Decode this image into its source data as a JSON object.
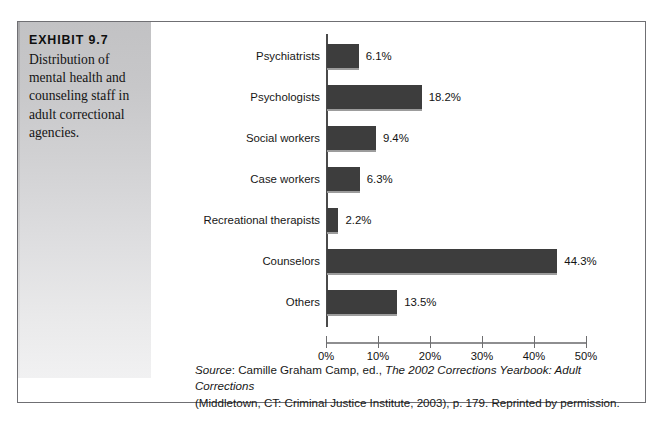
{
  "exhibit": {
    "number": "EXHIBIT 9.7",
    "caption": "Distribution of mental health and counseling staff in adult correctional agencies."
  },
  "source": {
    "label": "Source",
    "line1_pre": ": Camille Graham Camp, ed., ",
    "line1_title": "The 2002 Corrections Yearbook: Adult Corrections",
    "line2": "(Middletown, CT: Criminal Justice Institute, 2003), p. 179. Reprinted by permission."
  },
  "chart_data": {
    "type": "bar",
    "orientation": "horizontal",
    "title": "Distribution of mental health and counseling staff in adult correctional agencies.",
    "xlabel": "",
    "ylabel": "",
    "xlim": [
      0,
      50
    ],
    "xticks": [
      0,
      10,
      20,
      30,
      40,
      50
    ],
    "xtick_labels": [
      "0%",
      "10%",
      "20%",
      "30%",
      "40%",
      "50%"
    ],
    "grid": false,
    "legend": false,
    "bar_color": "#3d3d3d",
    "categories": [
      "Psychiatrists",
      "Psychologists",
      "Social workers",
      "Case workers",
      "Recreational therapists",
      "Counselors",
      "Others"
    ],
    "values": [
      6.1,
      18.2,
      9.4,
      6.3,
      2.2,
      44.3,
      13.5
    ],
    "value_labels": [
      "6.1%",
      "18.2%",
      "9.4%",
      "6.3%",
      "2.2%",
      "44.3%",
      "13.5%"
    ]
  }
}
